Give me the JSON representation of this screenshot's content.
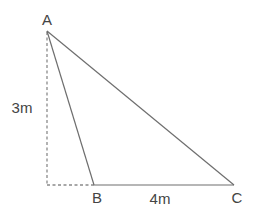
{
  "diagram": {
    "type": "geometry-triangle",
    "colors": {
      "line": "#6e6e6e",
      "dashed": "#8a8a8a",
      "text": "#444444",
      "background": "#ffffff"
    },
    "vertices": {
      "A": {
        "label": "A",
        "x": 47,
        "y": 31
      },
      "B": {
        "label": "B",
        "x": 94,
        "y": 185
      },
      "C": {
        "label": "C",
        "x": 234,
        "y": 185
      }
    },
    "foot": {
      "x": 47,
      "y": 185
    },
    "measurements": {
      "height": "3m",
      "base_bc": "4m"
    }
  }
}
